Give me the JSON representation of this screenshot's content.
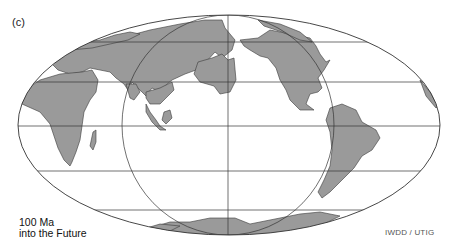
{
  "figure": {
    "panel_label": "(c)",
    "caption_line1": "100 Ma",
    "caption_line2": "into the Future",
    "credit": "IWDD / UTIG",
    "projection": "Mollweide (equal-area world map)",
    "land_color": "#9a9a9a",
    "ocean_color": "#ffffff",
    "line_color": "#333333"
  }
}
